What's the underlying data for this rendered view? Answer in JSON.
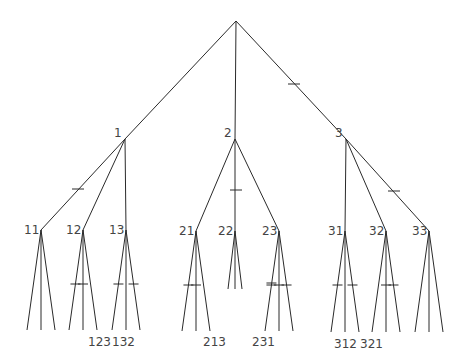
{
  "diagram": {
    "type": "tree",
    "root": {
      "x": 236,
      "y": 21
    },
    "level1": [
      {
        "id": "1",
        "label": "1",
        "x": 125,
        "y": 139
      },
      {
        "id": "2",
        "label": "2",
        "x": 235,
        "y": 139
      },
      {
        "id": "3",
        "label": "3",
        "x": 346,
        "y": 139
      }
    ],
    "level2": [
      {
        "id": "11",
        "label": "11",
        "parent": "1",
        "x": 41,
        "y": 230,
        "leafY": 330
      },
      {
        "id": "12",
        "label": "12",
        "parent": "1",
        "x": 83,
        "y": 230,
        "leafY": 330
      },
      {
        "id": "13",
        "label": "13",
        "parent": "1",
        "x": 126,
        "y": 230,
        "leafY": 330
      },
      {
        "id": "21",
        "label": "21",
        "parent": "2",
        "x": 196,
        "y": 231,
        "leafY": 331
      },
      {
        "id": "22",
        "label": "22",
        "parent": "2",
        "x": 235,
        "y": 231,
        "leafY": 289
      },
      {
        "id": "23",
        "label": "23",
        "parent": "2",
        "x": 279,
        "y": 231,
        "leafY": 331
      },
      {
        "id": "31",
        "label": "31",
        "parent": "3",
        "x": 345,
        "y": 231,
        "leafY": 332
      },
      {
        "id": "32",
        "label": "32",
        "parent": "3",
        "x": 386,
        "y": 231,
        "leafY": 332
      },
      {
        "id": "33",
        "label": "33",
        "parent": "3",
        "x": 429,
        "y": 231,
        "leafY": 332
      }
    ],
    "leaf_labels": [
      {
        "text": "123",
        "x": 88,
        "y": 336
      },
      {
        "text": "132",
        "x": 112,
        "y": 336
      },
      {
        "text": "213",
        "x": 203,
        "y": 336
      },
      {
        "text": "231",
        "x": 252,
        "y": 336
      },
      {
        "text": "312",
        "x": 334,
        "y": 338
      },
      {
        "text": "321",
        "x": 360,
        "y": 338
      }
    ],
    "edge_ticks": [
      {
        "on": "root-3",
        "x": 294,
        "y": 84
      },
      {
        "on": "1-11",
        "x": 78,
        "y": 189
      },
      {
        "on": "2-22",
        "x": 236,
        "y": 190
      },
      {
        "on": "3-33",
        "x": 394,
        "y": 191
      }
    ],
    "leaf_ticks": {
      "11": [],
      "12": [
        0,
        1
      ],
      "13": [
        0,
        2
      ],
      "21": [
        0,
        1
      ],
      "22": [],
      "23": [
        0,
        0,
        1,
        2
      ],
      "31": [
        0,
        2
      ],
      "32": [
        1,
        2
      ],
      "33": []
    }
  }
}
